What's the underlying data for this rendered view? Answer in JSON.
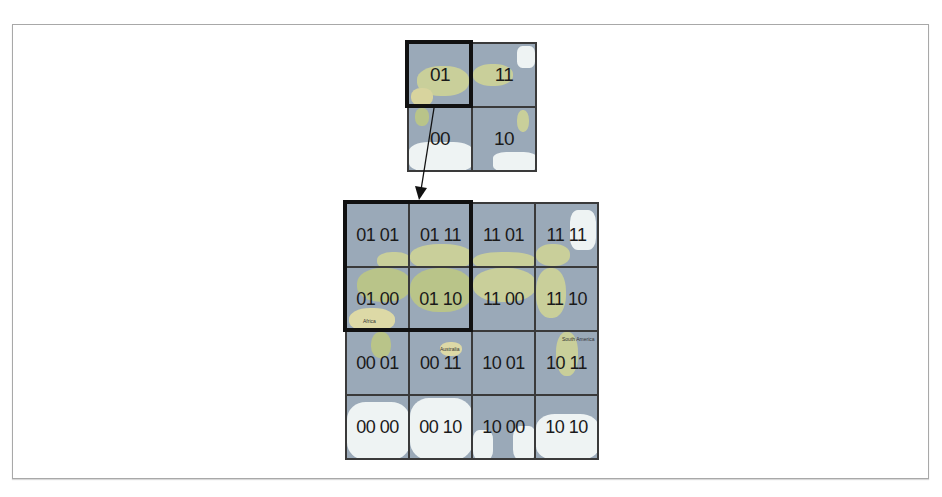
{
  "diagram": {
    "type": "quadtree-tile-addressing",
    "level1": {
      "grid_size": 2,
      "cells": [
        [
          "01",
          "11"
        ],
        [
          "00",
          "10"
        ]
      ],
      "highlighted": "01"
    },
    "level2": {
      "grid_size": 4,
      "cells": [
        [
          "01 01",
          "01 11",
          "11 01",
          "11 11"
        ],
        [
          "01 00",
          "01 10",
          "11 00",
          "11 10"
        ],
        [
          "00 01",
          "00 11",
          "10 01",
          "10 11"
        ],
        [
          "00 00",
          "00 10",
          "10 00",
          "10 10"
        ]
      ],
      "highlighted_block": [
        "01 01",
        "01 11",
        "01 00",
        "01 10"
      ]
    },
    "map_labels": {
      "africa": "Africa",
      "australia": "Australia",
      "south_america": "South America"
    },
    "arrow": {
      "from": "01",
      "to": "01 quadrant"
    },
    "colors": {
      "ocean": "#9aa9b8",
      "land": "#c9cf9a",
      "ice": "#eef3f3",
      "outline": "#111111",
      "frame": "#a8a8a8"
    }
  }
}
